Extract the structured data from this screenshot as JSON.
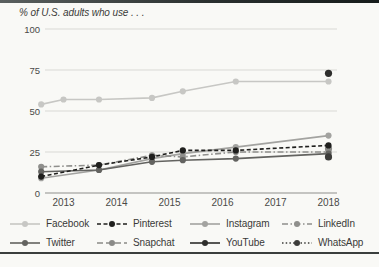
{
  "page": {
    "background": "#f9f9f6",
    "top_border_color": "#2a302f",
    "bottom_border_color": "#3a3e3d"
  },
  "chart_data": {
    "type": "line",
    "title": "% of U.S. adults who use . . .",
    "xlabel": "",
    "ylabel": "",
    "x_ticks": [
      2013,
      2014,
      2015,
      2016,
      2017,
      2018
    ],
    "y_ticks": [
      0,
      25,
      50,
      75,
      100
    ],
    "ylim": [
      0,
      100
    ],
    "xlim": [
      2012.4,
      2018.2
    ],
    "grid": "horizontal",
    "gridline_color": "#d9d9d5",
    "axis_line_color": "#8f8f8c",
    "tick_label_color": "#4a4a48",
    "legend_position": "bottom",
    "legend_rows": [
      [
        "Facebook",
        "Pinterest",
        "Instagram",
        "LinkedIn"
      ],
      [
        "Twitter",
        "Snapchat",
        "YouTube",
        "WhatsApp"
      ]
    ],
    "series": [
      {
        "name": "Facebook",
        "color": "#c7c7c4",
        "dash": "",
        "points": [
          [
            2012.58,
            54
          ],
          [
            2013.0,
            57
          ],
          [
            2013.67,
            57
          ],
          [
            2014.67,
            58
          ],
          [
            2015.25,
            62
          ],
          [
            2016.25,
            68
          ],
          [
            2018.0,
            68
          ]
        ]
      },
      {
        "name": "Instagram",
        "color": "#a3a3a0",
        "dash": "",
        "points": [
          [
            2012.58,
            9
          ],
          [
            2013.67,
            14
          ],
          [
            2014.67,
            21
          ],
          [
            2015.25,
            24
          ],
          [
            2016.25,
            28
          ],
          [
            2018.0,
            35
          ]
        ]
      },
      {
        "name": "LinkedIn",
        "color": "#8f8f8c",
        "dash": "6 2.5 1.5 2.5",
        "points": [
          [
            2012.58,
            16
          ],
          [
            2013.67,
            17
          ],
          [
            2014.67,
            23
          ],
          [
            2015.25,
            22
          ],
          [
            2016.25,
            25
          ],
          [
            2018.0,
            25
          ]
        ]
      },
      {
        "name": "Snapchat",
        "color": "#8a8a87",
        "dash": "6 3",
        "points": [
          [
            2018.0,
            27
          ]
        ]
      },
      {
        "name": "Twitter",
        "color": "#636360",
        "dash": "",
        "points": [
          [
            2012.58,
            13
          ],
          [
            2013.67,
            14
          ],
          [
            2014.67,
            19
          ],
          [
            2015.25,
            20
          ],
          [
            2016.25,
            21
          ],
          [
            2018.0,
            24
          ]
        ]
      },
      {
        "name": "WhatsApp",
        "color": "#3c3c3a",
        "dash": "1.5 2.2",
        "points": [
          [
            2018.0,
            22
          ]
        ]
      },
      {
        "name": "Pinterest",
        "color": "#1f1f1d",
        "dash": "4 2.5",
        "points": [
          [
            2012.58,
            10
          ],
          [
            2013.67,
            17
          ],
          [
            2014.67,
            22
          ],
          [
            2015.25,
            26
          ],
          [
            2016.25,
            26
          ],
          [
            2018.0,
            29
          ]
        ]
      },
      {
        "name": "YouTube",
        "color": "#2e2e2c",
        "dash": "",
        "points": [
          [
            2018.0,
            73
          ]
        ]
      }
    ]
  }
}
